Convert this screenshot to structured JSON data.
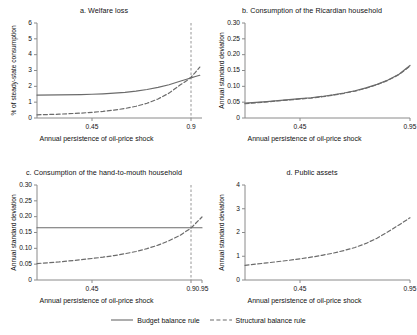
{
  "figure": {
    "background": "#ffffff",
    "line_color": "#6b6b6b",
    "axis_color": "#8a8a8a",
    "text_color": "#111111"
  },
  "legend": {
    "position": "bottom-center",
    "entries": [
      {
        "label": "Budget balance rule",
        "style": "solid",
        "icon": "solid-line-icon"
      },
      {
        "label": "Structural balance rule",
        "style": "dashed",
        "icon": "dashed-line-icon"
      }
    ]
  },
  "chart_data": [
    {
      "id": "a",
      "type": "line",
      "title": "a. Welfare loss",
      "xlabel": "Annual persistence of oil-price shock",
      "ylabel": "% of steady-state consumption",
      "xlim": [
        0.2,
        0.95
      ],
      "ylim": [
        0,
        6
      ],
      "xticks": [
        0.45,
        0.9
      ],
      "xticklabels": [
        "0.45",
        "0.9"
      ],
      "yticks": [
        0,
        1,
        2,
        3,
        4,
        5,
        6
      ],
      "yticklabels": [
        "0",
        "1",
        "2",
        "3",
        "4",
        "5",
        "6"
      ],
      "grid": false,
      "vline": {
        "x": 0.9,
        "style": "dashed"
      },
      "x": [
        0.2,
        0.3,
        0.4,
        0.45,
        0.5,
        0.55,
        0.6,
        0.65,
        0.7,
        0.75,
        0.8,
        0.85,
        0.88,
        0.9,
        0.92,
        0.94
      ],
      "series": [
        {
          "name": "Budget balance rule",
          "style": "solid",
          "values": [
            1.45,
            1.46,
            1.48,
            1.5,
            1.53,
            1.57,
            1.62,
            1.7,
            1.8,
            1.93,
            2.1,
            2.32,
            2.45,
            2.53,
            2.62,
            2.7
          ]
        },
        {
          "name": "Structural balance rule",
          "style": "dashed",
          "values": [
            0.2,
            0.24,
            0.31,
            0.36,
            0.42,
            0.5,
            0.6,
            0.74,
            0.93,
            1.2,
            1.57,
            2.08,
            2.35,
            2.58,
            2.88,
            3.22
          ]
        }
      ]
    },
    {
      "id": "b",
      "type": "line",
      "title": "b. Consumption of the Ricardian household",
      "xlabel": "Annual persistence of oil-price shock",
      "ylabel": "Annual standard deviation",
      "xlim": [
        0.2,
        0.95
      ],
      "ylim": [
        0,
        0.3
      ],
      "xticks": [
        0.45,
        0.95
      ],
      "xticklabels": [
        "0.45",
        "0.95"
      ],
      "yticks": [
        0,
        0.05,
        0.1,
        0.15,
        0.2,
        0.25,
        0.3
      ],
      "yticklabels": [
        "0",
        "0.05",
        "0.10",
        "0.15",
        "0.20",
        "0.25",
        "0.30"
      ],
      "grid": false,
      "x": [
        0.2,
        0.3,
        0.4,
        0.45,
        0.5,
        0.55,
        0.6,
        0.65,
        0.7,
        0.75,
        0.8,
        0.85,
        0.9,
        0.95
      ],
      "series": [
        {
          "name": "Budget balance rule",
          "style": "solid",
          "values": [
            0.047,
            0.052,
            0.058,
            0.061,
            0.064,
            0.068,
            0.073,
            0.079,
            0.086,
            0.095,
            0.106,
            0.12,
            0.138,
            0.166
          ]
        },
        {
          "name": "Structural balance rule",
          "style": "dashed",
          "values": [
            0.045,
            0.051,
            0.057,
            0.06,
            0.063,
            0.067,
            0.072,
            0.078,
            0.085,
            0.094,
            0.105,
            0.119,
            0.137,
            0.164
          ]
        }
      ]
    },
    {
      "id": "c",
      "type": "line",
      "title": "c. Consumption of the hand-to-mouth household",
      "xlabel": "Annual persistence of oil-price shock",
      "ylabel": "Annual standard deviation",
      "xlim": [
        0.2,
        0.95
      ],
      "ylim": [
        0,
        0.3
      ],
      "xticks": [
        0.45,
        0.9,
        0.95
      ],
      "xticklabels": [
        "0.45",
        "0.9",
        "0.95"
      ],
      "yticks": [
        0,
        0.05,
        0.1,
        0.15,
        0.2,
        0.25,
        0.3
      ],
      "yticklabels": [
        "0",
        "0.05",
        "0.10",
        "0.15",
        "0.20",
        "0.25",
        "0.30"
      ],
      "grid": false,
      "vline": {
        "x": 0.9,
        "style": "dashed"
      },
      "x": [
        0.2,
        0.3,
        0.4,
        0.45,
        0.5,
        0.55,
        0.6,
        0.65,
        0.7,
        0.75,
        0.8,
        0.85,
        0.9,
        0.95
      ],
      "series": [
        {
          "name": "Budget balance rule",
          "style": "solid",
          "values": [
            0.165,
            0.165,
            0.165,
            0.165,
            0.165,
            0.165,
            0.165,
            0.165,
            0.165,
            0.165,
            0.165,
            0.165,
            0.165,
            0.165
          ]
        },
        {
          "name": "Structural balance rule",
          "style": "dashed",
          "values": [
            0.052,
            0.057,
            0.064,
            0.068,
            0.072,
            0.077,
            0.083,
            0.09,
            0.099,
            0.11,
            0.124,
            0.141,
            0.164,
            0.199
          ]
        }
      ]
    },
    {
      "id": "d",
      "type": "line",
      "title": "d. Public assets",
      "xlabel": "Annual persistence of oil-price shock",
      "ylabel": "Annual standard deviation",
      "xlim": [
        0.2,
        0.95
      ],
      "ylim": [
        0,
        4
      ],
      "xticks": [
        0.45,
        0.95
      ],
      "xticklabels": [
        "0.45",
        "0.95"
      ],
      "yticks": [
        0,
        1,
        2,
        3,
        4
      ],
      "yticklabels": [
        "0",
        "1",
        "2",
        "3",
        "4"
      ],
      "grid": false,
      "x": [
        0.2,
        0.3,
        0.4,
        0.45,
        0.5,
        0.55,
        0.6,
        0.65,
        0.7,
        0.75,
        0.8,
        0.85,
        0.9,
        0.95
      ],
      "series": [
        {
          "name": "Structural balance rule",
          "style": "dashed",
          "values": [
            0.62,
            0.72,
            0.83,
            0.89,
            0.96,
            1.04,
            1.13,
            1.24,
            1.37,
            1.54,
            1.76,
            2.03,
            2.32,
            2.62
          ]
        }
      ]
    }
  ]
}
